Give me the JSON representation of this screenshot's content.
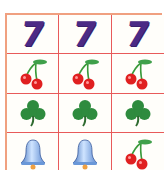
{
  "reels": {
    "rows": [
      [
        "seven",
        "seven",
        "seven"
      ],
      [
        "cherry",
        "cherry",
        "cherry"
      ],
      [
        "clover",
        "clover",
        "clover"
      ],
      [
        "bell",
        "bell",
        "cherry"
      ]
    ]
  },
  "symbols": {
    "seven": {
      "glyph": "7",
      "color": "#4b2a85"
    },
    "cherry": {
      "color": "#e02020",
      "stem_color": "#3a9a3a"
    },
    "clover": {
      "color": "#2e8b3e"
    },
    "bell": {
      "color": "#7aa8e0",
      "clapper_color": "#f0a040"
    }
  },
  "colors": {
    "grid_line": "#e85a5a",
    "outer_border": "#f0a080",
    "background": "#fffefa"
  }
}
